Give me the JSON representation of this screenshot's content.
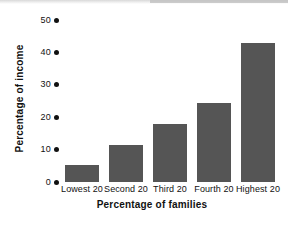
{
  "chart_data": {
    "type": "bar",
    "title": "",
    "xlabel": "Percentage of families",
    "ylabel": "Percentage of income",
    "categories": [
      "Lowest 20",
      "Second 20",
      "Third 20",
      "Fourth 20",
      "Highest 20"
    ],
    "values": [
      5.3,
      11.3,
      18.0,
      24.5,
      43.0
    ],
    "ylim": [
      0,
      50
    ],
    "yticks": [
      0,
      10,
      20,
      30,
      40,
      50
    ],
    "ytick_labels": [
      "0",
      "10",
      "20",
      "30",
      "40",
      "50"
    ],
    "grid": false,
    "legend": null,
    "series": [
      {
        "name": "Percentage of income",
        "values": [
          5.3,
          11.3,
          18.0,
          24.5,
          43.0
        ]
      }
    ],
    "bar_color": "#555555",
    "tick_marker": "filled-dot",
    "background_color": "#ffffff",
    "text_color": "#111111"
  }
}
